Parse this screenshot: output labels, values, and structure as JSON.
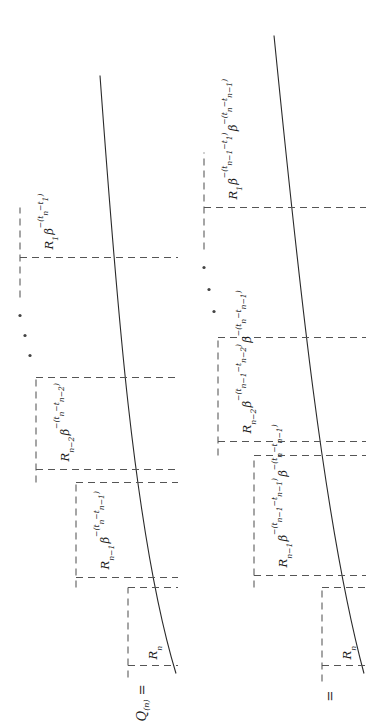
{
  "figure": {
    "kind": "math-staircase-diagram",
    "orientation_deg": -90,
    "rows": [
      {
        "id": "row-1",
        "lead_label": "Q",
        "lead_subscript": "(n)",
        "lead_equals": "=",
        "terms": [
          {
            "coef": "R",
            "coef_sub": "n",
            "factors": []
          },
          {
            "coef": "R",
            "coef_sub": "n−1",
            "factors": [
              {
                "base": "β",
                "exp": "−(tₙ − tₙ₋₁)"
              }
            ]
          },
          {
            "coef": "R",
            "coef_sub": "n−2",
            "factors": [
              {
                "base": "β",
                "exp": "−(tₙ − tₙ₋₂)"
              }
            ]
          },
          {
            "coef": "R",
            "coef_sub": "1",
            "factors": [
              {
                "base": "β",
                "exp": "−(tₙ − t₁)"
              }
            ]
          }
        ],
        "ellipsis": "⋰"
      },
      {
        "id": "row-2",
        "lead_label": "",
        "lead_subscript": "",
        "lead_equals": "=",
        "terms": [
          {
            "coef": "R",
            "coef_sub": "n",
            "factors": []
          },
          {
            "coef": "R",
            "coef_sub": "n−1",
            "factors": [
              {
                "base": "β",
                "exp": "−(tₙ₋₁ − tₙ₋₁)"
              },
              {
                "base": "β",
                "exp": "−(tₙ − tₙ₋₁)"
              }
            ]
          },
          {
            "coef": "R",
            "coef_sub": "n−2",
            "factors": [
              {
                "base": "β",
                "exp": "−(tₙ₋₁ − tₙ₋₂)"
              },
              {
                "base": "β",
                "exp": "−(tₙ − tₙ₋₁)"
              }
            ]
          },
          {
            "coef": "R",
            "coef_sub": "1",
            "factors": [
              {
                "base": "β",
                "exp": "−(tₙ₋₁ − t₁)"
              },
              {
                "base": "β",
                "exp": "−(tₙ − tₙ₋₁)"
              }
            ]
          }
        ],
        "ellipsis": "⋰"
      }
    ],
    "labels": {
      "row1_lead_full": "Q(n) =",
      "row2_lead_full": "=",
      "row1_term1": "Rₙ",
      "row1_term2": "Rₙ₋₁ β^−(tₙ − tₙ₋₁)",
      "row1_term3": "Rₙ₋₂ β^−(tₙ − tₙ₋₂)",
      "row1_term4": "R₁ β^−(tₙ − t₁)",
      "row2_term1": "Rₙ",
      "row2_term2": "Rₙ₋₁ β^−(tₙ₋₁ − tₙ₋₁) β^−(tₙ − tₙ₋₁)",
      "row2_term3": "Rₙ₋₂ β^−(tₙ₋₁ − tₙ₋₂) β^−(tₙ − tₙ₋₁)",
      "row2_term4": "R₁ β^−(tₙ₋₁ − t₁) β^−(tₙ − tₙ₋₁)"
    },
    "colors": {
      "ink": "#1a1a1a",
      "dash": "#555555",
      "brace": "#2a2a2a",
      "background": "#ffffff"
    }
  }
}
